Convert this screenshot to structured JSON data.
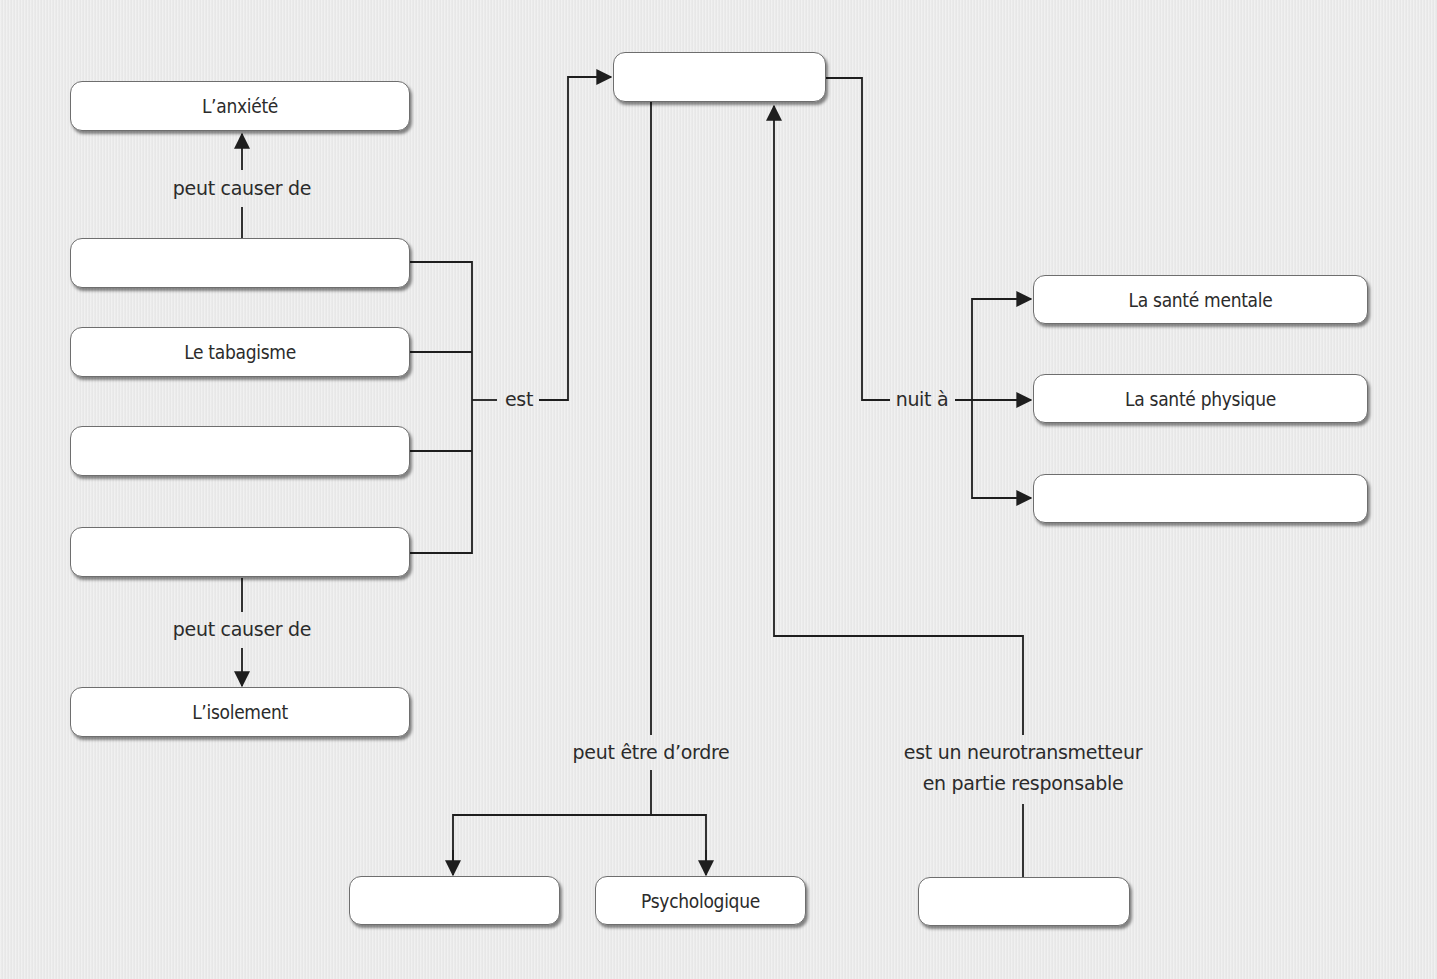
{
  "diagram": {
    "colors": {
      "background": "#e9e9e9",
      "box_fill": "#ffffff",
      "box_border": "#6e6e6e",
      "line": "#1e1e1e",
      "text": "#2b2b2b"
    },
    "central": {
      "text": "",
      "placeholder": ""
    },
    "left_column": {
      "top": {
        "text": "L’anxiété"
      },
      "items": [
        {
          "text": "",
          "placeholder": ""
        },
        {
          "text": "Le tabagisme"
        },
        {
          "text": "",
          "placeholder": ""
        },
        {
          "text": "",
          "placeholder": ""
        }
      ],
      "bottom": {
        "text": "L’isolement"
      }
    },
    "right_column": {
      "items": [
        {
          "text": "La santé mentale"
        },
        {
          "text": "La santé physique"
        },
        {
          "text": "",
          "placeholder": ""
        }
      ]
    },
    "bottom_row": {
      "origin_left": {
        "text": "",
        "placeholder": ""
      },
      "origin_right": {
        "text": "Psychologique"
      },
      "neurotransmitter": {
        "text": "",
        "placeholder": ""
      }
    },
    "links": {
      "causes_up": "peut causer de",
      "causes_down": "peut causer de",
      "est": "est",
      "nuit_a": "nuit à",
      "peut_etre_ordre": "peut être d’ordre",
      "neuro_line1": "est un neurotransmetteur",
      "neuro_line2": "en partie responsable"
    }
  }
}
